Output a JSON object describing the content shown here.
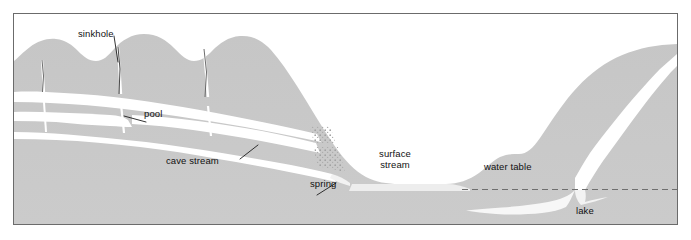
{
  "figure": {
    "kind": "karst-cross-section-diagram",
    "frame_border_color": "#6b6b6b",
    "background_color": "#ffffff"
  },
  "palette": {
    "bedrock_gray": "#c9c9c9",
    "hill_gray": "#bdbdbd",
    "cave_void_white": "#ffffff",
    "water_light": "#ededed",
    "lake_white": "#f7f7f7",
    "stipple_gray": "#b4b4b4",
    "line_dark": "#3a3a3a",
    "water_table_dash": "#6f6f6f",
    "text_color": "#111111"
  },
  "labels": [
    {
      "id": "sinkhole",
      "text": "sinkhole",
      "x": 77,
      "y": 26,
      "leader": true
    },
    {
      "id": "pool",
      "text": "pool",
      "x": 142,
      "y": 106,
      "leader": true
    },
    {
      "id": "cave-stream",
      "text": "cave stream",
      "x": 166,
      "y": 153,
      "leader": true
    },
    {
      "id": "spring",
      "text": "spring",
      "x": 311,
      "y": 176,
      "leader": true
    },
    {
      "id": "surface-stream-1",
      "text": "surface",
      "x": 381,
      "y": 146,
      "leader": false
    },
    {
      "id": "surface-stream-2",
      "text": "stream",
      "x": 381,
      "y": 157,
      "leader": false
    },
    {
      "id": "water-table",
      "text": "water table",
      "x": 497,
      "y": 159,
      "leader": false
    },
    {
      "id": "lake",
      "text": "lake",
      "x": 578,
      "y": 203,
      "leader": false
    }
  ],
  "features": {
    "sinkholes_count": 3,
    "cave_levels": 3,
    "water_table_line_style": "dashed",
    "water_table_y": 175
  }
}
